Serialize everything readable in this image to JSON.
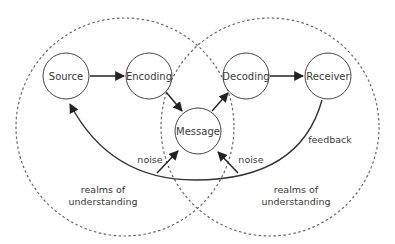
{
  "diagram": {
    "nodes": {
      "source": "Source",
      "encoding": "Encoding",
      "message": "Message",
      "decoding": "Decoding",
      "receiver": "Receiver"
    },
    "labels": {
      "noise_left": "noise",
      "noise_right": "noise",
      "feedback": "feedback",
      "realms_left_line1": "realms of",
      "realms_left_line2": "understanding",
      "realms_right_line1": "realms of",
      "realms_right_line2": "understanding"
    },
    "edges": [
      {
        "from": "Source",
        "to": "Encoding"
      },
      {
        "from": "Encoding",
        "to": "Message"
      },
      {
        "from": "Message",
        "to": "Decoding"
      },
      {
        "from": "Decoding",
        "to": "Receiver"
      },
      {
        "from": "Receiver",
        "to": "Source",
        "label": "feedback"
      },
      {
        "from": "noise",
        "to": "Message"
      },
      {
        "from": "noise",
        "to": "Message"
      }
    ],
    "colors": {
      "stroke": "#333333",
      "dashed": "#666666",
      "text": "#3a3a3a"
    }
  }
}
